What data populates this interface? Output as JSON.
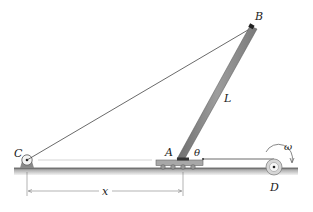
{
  "diagram": {
    "labels": {
      "C": "C",
      "B": "B",
      "L": "L",
      "A": "A",
      "theta": "θ",
      "omega": "ω",
      "D": "D",
      "x": "x"
    },
    "colors": {
      "bar": "#8c8c8c",
      "ground": "#9a9a9a",
      "line": "#333333",
      "cart": "#a8a8a8"
    }
  }
}
